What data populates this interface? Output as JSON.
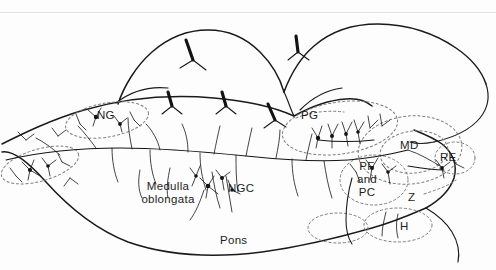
{
  "figure": {
    "type": "neuroanatomical-sagittal-section",
    "background_color": "#fdfdfd",
    "ink_color": "#1a1a1a",
    "dashed_color": "#777777",
    "width": 496,
    "height": 270
  },
  "labels": {
    "ng": "NG",
    "ngc": "NGC",
    "pg": "PG",
    "md": "MD",
    "re": "RE",
    "z": "Z",
    "h": "H",
    "pf_and_pc": "PF\nand\nPC",
    "medulla_oblongata": "Medulla\noblongata",
    "pons": "Pons"
  },
  "regions": [
    {
      "id": "ng",
      "label": "NG",
      "kind": "dashed-nucleus-outline"
    },
    {
      "id": "pg",
      "label": "PG",
      "kind": "dashed-nucleus-outline"
    },
    {
      "id": "md",
      "label": "MD",
      "kind": "dashed-nucleus-outline"
    },
    {
      "id": "re",
      "label": "RE",
      "kind": "dashed-nucleus-outline"
    },
    {
      "id": "z",
      "label": "Z",
      "kind": "dashed-nucleus-outline"
    },
    {
      "id": "h",
      "label": "H",
      "kind": "dashed-nucleus-outline"
    },
    {
      "id": "pfpc",
      "label": "PF and PC",
      "kind": "dashed-nucleus-outline"
    },
    {
      "id": "ngc",
      "label": "NGC",
      "kind": "reticular-field"
    },
    {
      "id": "medulla",
      "label": "Medulla oblongata",
      "kind": "anatomical-area"
    },
    {
      "id": "pons",
      "label": "Pons",
      "kind": "anatomical-area"
    }
  ]
}
